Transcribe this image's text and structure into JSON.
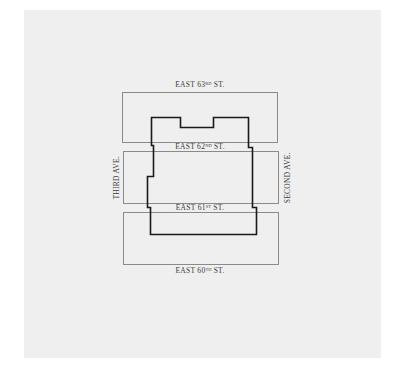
{
  "map": {
    "type": "site-plan",
    "background_color": "#efefef",
    "outline_color": "#1a1a1a",
    "block_border_color": "#8a8a8a",
    "streets": [
      {
        "id": "east-63rd",
        "name": "EAST 63",
        "suffix": "RD",
        "tail": " ST."
      },
      {
        "id": "east-62nd",
        "name": "EAST 62",
        "suffix": "ND",
        "tail": " ST."
      },
      {
        "id": "east-61st",
        "name": "EAST 61",
        "suffix": "ST",
        "tail": " ST."
      },
      {
        "id": "east-60th",
        "name": "EAST 60",
        "suffix": "TH",
        "tail": " ST."
      }
    ],
    "avenues": [
      {
        "id": "third-ave",
        "name": "THIRD AVE."
      },
      {
        "id": "second-ave",
        "name": "SECOND AVE."
      }
    ],
    "blocks": [
      {
        "id": "block-62-63",
        "label": "Block between East 62nd and East 63rd St."
      },
      {
        "id": "block-61-62",
        "label": "Block between East 61st and East 62nd St."
      },
      {
        "id": "block-60-61",
        "label": "Block between East 60th and East 61st St."
      }
    ]
  }
}
